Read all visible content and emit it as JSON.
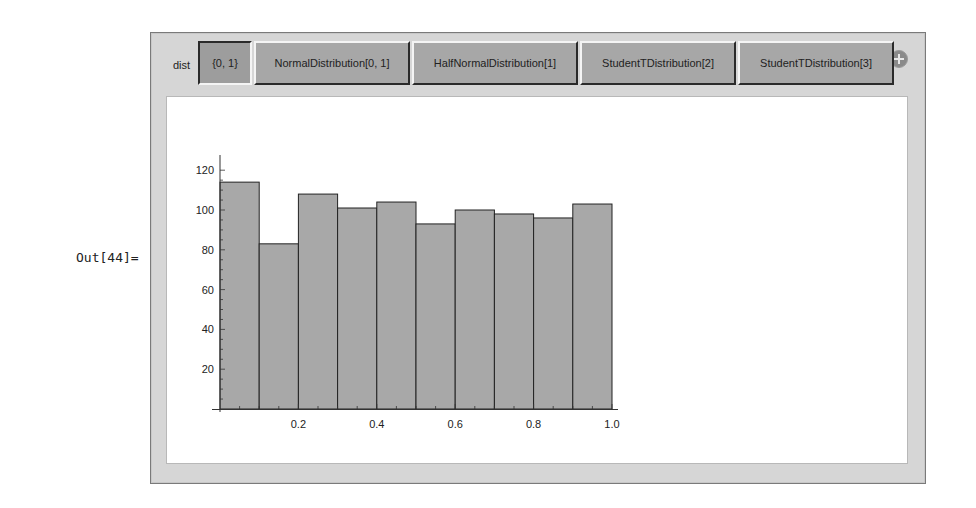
{
  "cell": {
    "out_label": "Out[44]="
  },
  "manipulate": {
    "control_label": "dist",
    "add_button_icon": "plus-circle-icon",
    "setters": [
      {
        "label": "{0, 1}",
        "selected": true,
        "width": 54
      },
      {
        "label": "NormalDistribution[0, 1]",
        "selected": false,
        "width": 156
      },
      {
        "label": "HalfNormalDistribution[1]",
        "selected": false,
        "width": 166
      },
      {
        "label": "StudentTDistribution[2]",
        "selected": false,
        "width": 156
      },
      {
        "label": "StudentTDistribution[3]",
        "selected": false,
        "width": 156
      }
    ]
  },
  "chart_data": {
    "type": "bar",
    "title": "",
    "xlabel": "",
    "ylabel": "",
    "bin_edges": [
      0.0,
      0.1,
      0.2,
      0.3,
      0.4,
      0.5,
      0.6,
      0.7,
      0.8,
      0.9,
      1.0
    ],
    "categories": [
      "0.0-0.1",
      "0.1-0.2",
      "0.2-0.3",
      "0.3-0.4",
      "0.4-0.5",
      "0.5-0.6",
      "0.6-0.7",
      "0.7-0.8",
      "0.8-0.9",
      "0.9-1.0"
    ],
    "values": [
      114,
      83,
      108,
      101,
      104,
      93,
      100,
      98,
      96,
      103
    ],
    "xlim": [
      0.0,
      1.0
    ],
    "ylim": [
      0,
      125
    ],
    "x_ticks": [
      "0.2",
      "0.4",
      "0.6",
      "0.8",
      "1.0"
    ],
    "x_tick_values": [
      0.2,
      0.4,
      0.6,
      0.8,
      1.0
    ],
    "y_ticks": [
      "20",
      "40",
      "60",
      "80",
      "100",
      "120"
    ],
    "y_tick_values": [
      20,
      40,
      60,
      80,
      100,
      120
    ],
    "grid": false,
    "legend": "none",
    "bar_color": "#a8a8a8",
    "edge_color": "#222222"
  }
}
